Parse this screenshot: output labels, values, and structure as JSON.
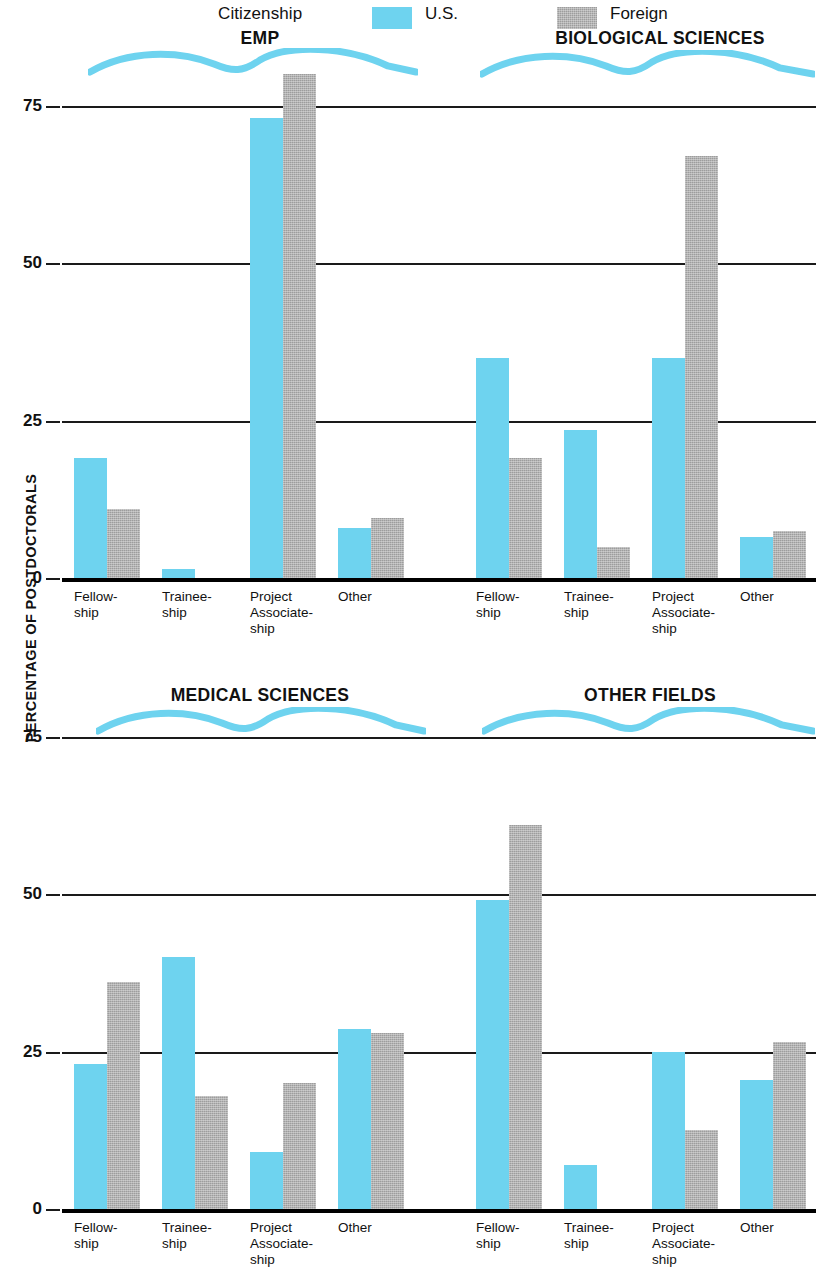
{
  "legend": {
    "citizenship_label": "Citizenship",
    "us_label": "U.S.",
    "foreign_label": "Foreign",
    "us_color": "#6ed3ef",
    "foreign_color": "#9d9d9d"
  },
  "axis": {
    "ylabel": "PERCENTAGE OF POSTDOCTORALS",
    "ticks_top": [
      "75",
      "50",
      "25",
      "0"
    ],
    "ticks_bottom": [
      "75",
      "50",
      "25",
      "0"
    ]
  },
  "categories": [
    "Fellow-\nship",
    "Trainee-\nship",
    "Project\nAssociate-\nship",
    "Other"
  ],
  "panels": [
    {
      "title": "EMP"
    },
    {
      "title": "BIOLOGICAL SCIENCES"
    },
    {
      "title": "MEDICAL SCIENCES"
    },
    {
      "title": "OTHER FIELDS"
    }
  ],
  "chart_data": {
    "type": "bar",
    "xlabel": "",
    "ylabel": "PERCENTAGE OF POSTDOCTORALS",
    "ylim": [
      0,
      85
    ],
    "yticks": [
      0,
      25,
      50,
      75
    ],
    "grid": true,
    "legend": [
      "U.S.",
      "Foreign"
    ],
    "legend_position": "top",
    "legend_group_label": "Citizenship",
    "categories": [
      "Fellowship",
      "Traineeship",
      "Project Associateship",
      "Other"
    ],
    "panels": [
      {
        "name": "EMP",
        "series": [
          {
            "name": "U.S.",
            "values": [
              19,
              1.5,
              73,
              8
            ]
          },
          {
            "name": "Foreign",
            "values": [
              11,
              0,
              80,
              9.5
            ]
          }
        ]
      },
      {
        "name": "BIOLOGICAL SCIENCES",
        "series": [
          {
            "name": "U.S.",
            "values": [
              35,
              23.5,
              35,
              6.5
            ]
          },
          {
            "name": "Foreign",
            "values": [
              19,
              5,
              67,
              7.5
            ]
          }
        ]
      },
      {
        "name": "MEDICAL SCIENCES",
        "series": [
          {
            "name": "U.S.",
            "values": [
              23,
              40,
              9,
              28.5
            ]
          },
          {
            "name": "Foreign",
            "values": [
              36,
              18,
              20,
              28
            ]
          }
        ]
      },
      {
        "name": "OTHER FIELDS",
        "series": [
          {
            "name": "U.S.",
            "values": [
              49,
              7,
              25,
              20.5
            ]
          },
          {
            "name": "Foreign",
            "values": [
              61,
              0,
              12.5,
              26.5
            ]
          }
        ]
      }
    ]
  }
}
